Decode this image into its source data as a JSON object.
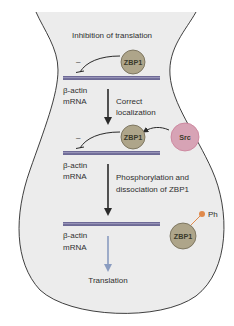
{
  "diagram": {
    "title": "Inhibition of translation",
    "colors": {
      "cell_fill": "#ececec",
      "cell_outline": "#2a2a2a",
      "mrna": "#6e6a96",
      "zbp1_fill": "#aea58a",
      "zbp1_stroke": "#6d6650",
      "src_fill": "#d7a3b5",
      "src_stroke": "#c97f98",
      "phospho": "#e08a4c",
      "arrow_dark": "#2a2a2a",
      "arrow_translation": "#8a9cc0"
    },
    "step1": {
      "inhibition_symbol": "–",
      "protein": "ZBP1",
      "mrna_label_line1": "β-actin",
      "mrna_label_line2": "mRNA"
    },
    "transition1": {
      "label_line1": "Correct",
      "label_line2": "localization"
    },
    "step2": {
      "kinase": "Src",
      "inhibition_symbol": "–",
      "protein": "ZBP1",
      "mrna_label_line1": "β-actin",
      "mrna_label_line2": "mRNA"
    },
    "transition2": {
      "label_line1": "Phosphorylation and",
      "label_line2": "dissociation of ZBP1"
    },
    "step3": {
      "protein": "ZBP1",
      "phospho_label": "Ph",
      "mrna_label_line1": "β-actin",
      "mrna_label_line2": "mRNA"
    },
    "outcome": {
      "label": "Translation"
    }
  }
}
